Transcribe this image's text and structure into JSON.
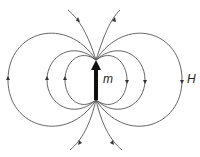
{
  "diagram": {
    "moment_label": "m",
    "field_label": "H",
    "line_color": "#555555",
    "arrow_color": "#111111"
  }
}
